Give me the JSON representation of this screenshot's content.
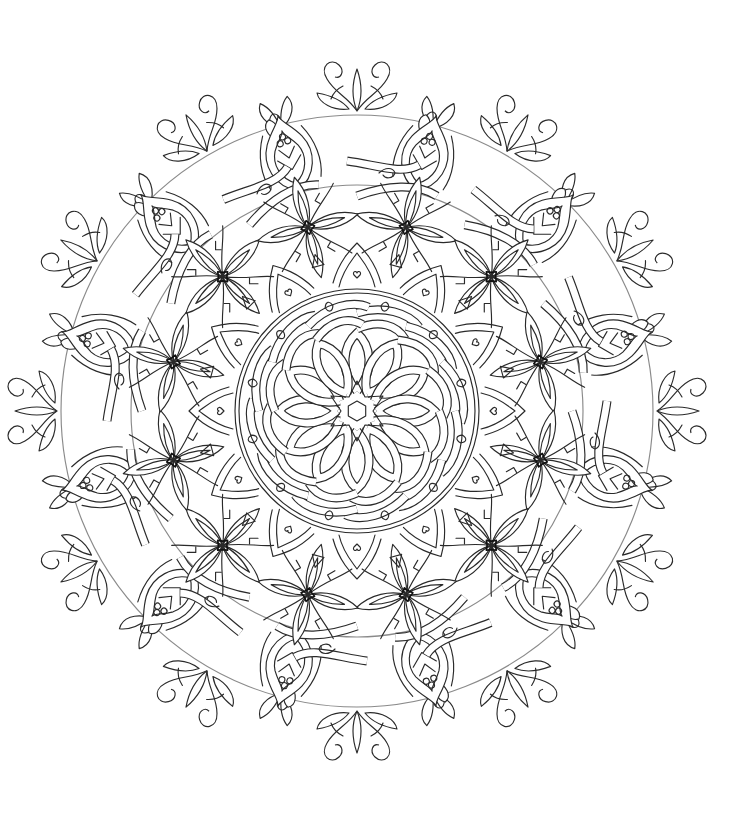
{
  "page": {
    "background": "#ffffff",
    "line_color": "#2a2a2a",
    "width": 752,
    "height": 825
  },
  "mandala": {
    "name": "celtic-floral-mandala-coloring-page",
    "center": [
      357,
      411
    ],
    "outer_radius": 350,
    "symmetry": 12,
    "rings": [
      {
        "name": "celtic-knot-core",
        "radius": 100
      },
      {
        "name": "heart-accent-ring",
        "radius": 140
      },
      {
        "name": "star-flower-ring",
        "radius": 185,
        "count": 12
      },
      {
        "name": "interlaced-vine-ring",
        "radius": 240
      },
      {
        "name": "bud-ring",
        "radius": 275,
        "count": 12
      },
      {
        "name": "leaf-scroll-ring",
        "radius": 315
      },
      {
        "name": "fleur-tip-ring",
        "radius": 340,
        "count": 12
      }
    ]
  }
}
